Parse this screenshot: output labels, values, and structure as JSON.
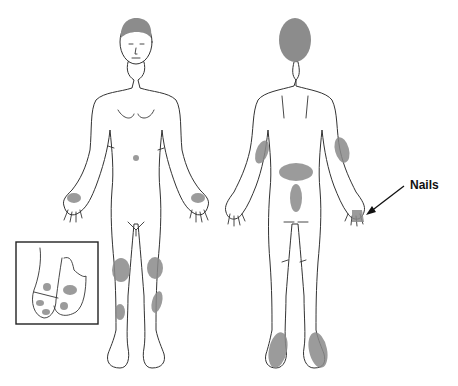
{
  "figure": {
    "type": "anatomical-distribution-diagram",
    "views": [
      {
        "name": "anterior",
        "lesion_sites": [
          "palms",
          "knees",
          "anterior shins",
          "umbilicus"
        ]
      },
      {
        "name": "posterior",
        "lesion_sites": [
          "elbows (extensor forearms)",
          "lower back (sacral)",
          "gluteal cleft",
          "soles",
          "nails"
        ]
      }
    ],
    "inset": {
      "name": "feet-detail",
      "lesion_sites": [
        "dorsum of toes"
      ]
    },
    "annotation": {
      "label": "Nails",
      "arrow": "points to posterior-view left hand fingernails"
    },
    "colors": {
      "outline": "#333333",
      "lesion": "#8a8a8a",
      "hair": "#8c8c8c",
      "background": "#ffffff"
    }
  }
}
